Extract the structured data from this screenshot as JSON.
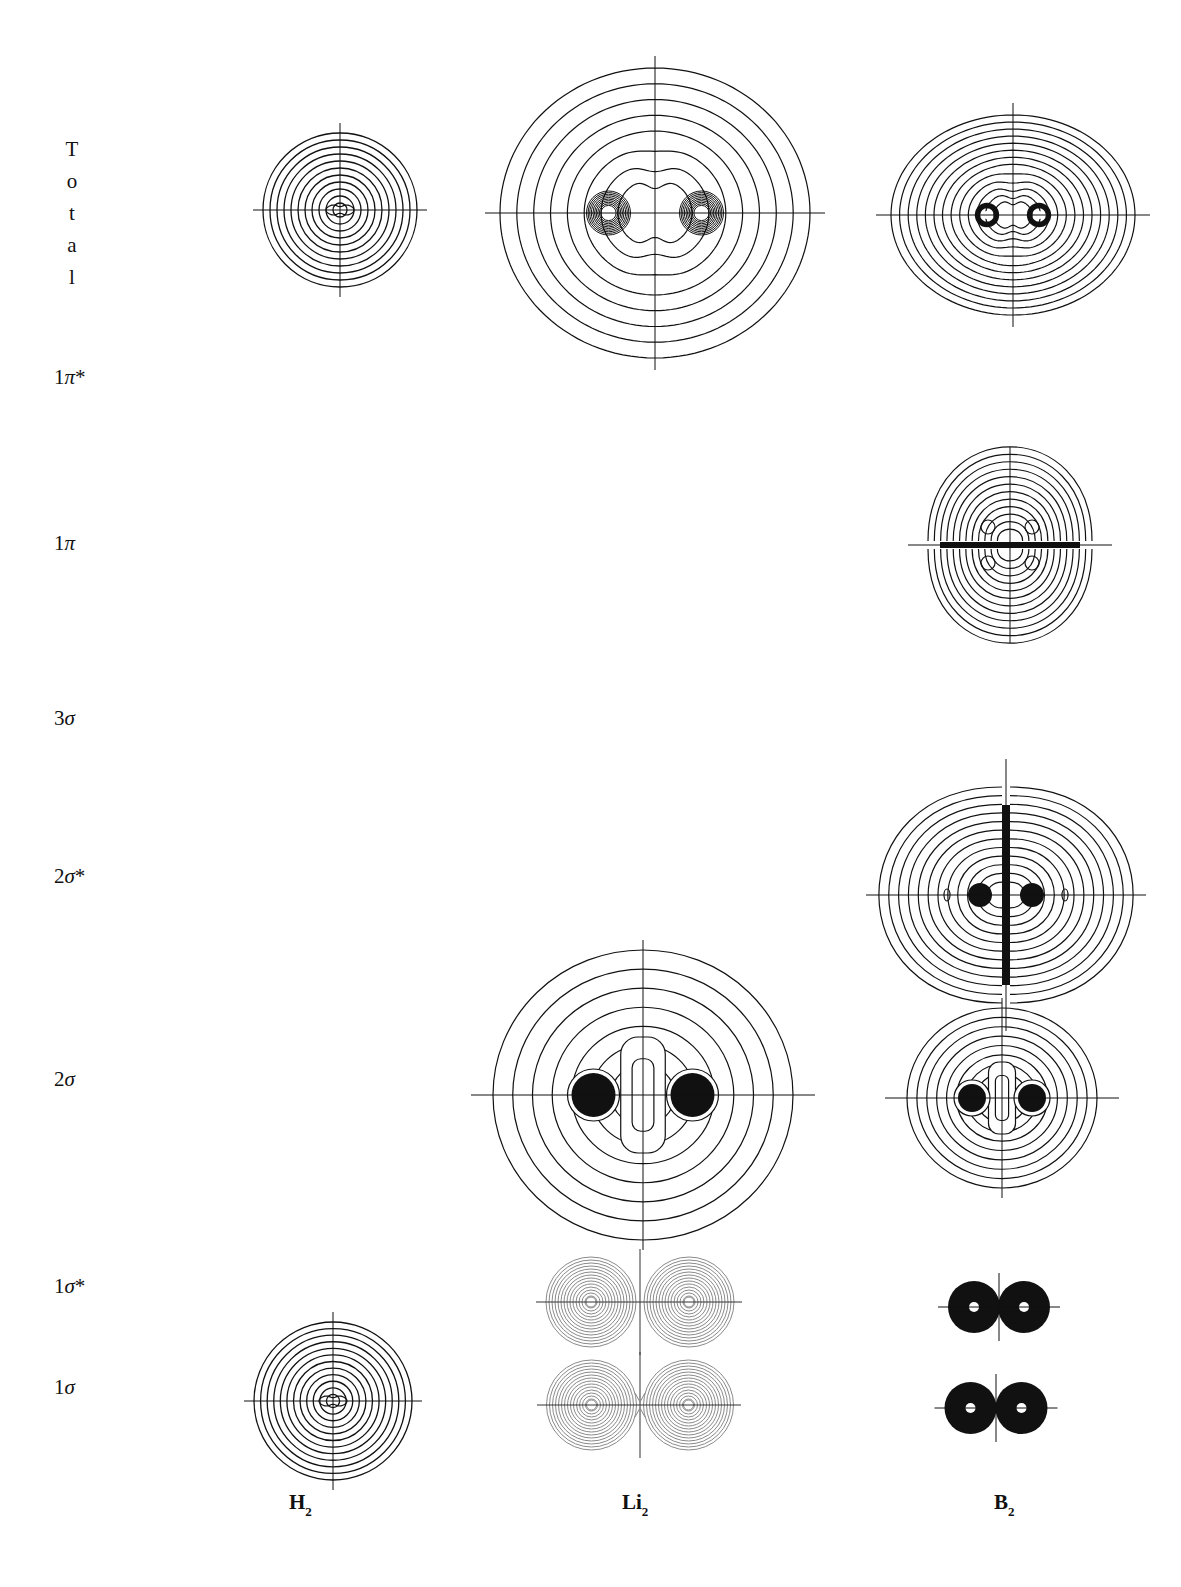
{
  "figure": {
    "row_labels": {
      "total": [
        "T",
        "o",
        "t",
        "a",
        "l"
      ],
      "pi_star_1": {
        "num": "1",
        "sym": "π",
        "star": "*"
      },
      "pi_1": {
        "num": "1",
        "sym": "π",
        "star": ""
      },
      "sigma_3": {
        "num": "3",
        "sym": "σ",
        "star": ""
      },
      "sigma_star_2": {
        "num": "2",
        "sym": "σ",
        "star": "*"
      },
      "sigma_2": {
        "num": "2",
        "sym": "σ",
        "star": ""
      },
      "sigma_star_1": {
        "num": "1",
        "sym": "σ",
        "star": "*"
      },
      "sigma_1": {
        "num": "1",
        "sym": "σ",
        "star": ""
      }
    },
    "column_labels": [
      {
        "base": "H",
        "sub": "2"
      },
      {
        "base": "Li",
        "sub": "2"
      },
      {
        "base": "B",
        "sub": "2"
      }
    ]
  },
  "plots": [
    {
      "id": "h2-total",
      "row": "Total",
      "molecule": "H2",
      "type": "concentric",
      "cx": 340,
      "cy": 210,
      "rx": 77,
      "ry": 77,
      "rings": 11,
      "core": "peanut",
      "nuclei_sep": 14
    },
    {
      "id": "li2-total",
      "row": "Total",
      "molecule": "Li2",
      "type": "total-two-center",
      "cx": 655,
      "cy": 213,
      "rx": 155,
      "ry": 145,
      "rings": 8,
      "nuclei_sep": 93,
      "core_rings": 10
    },
    {
      "id": "b2-total",
      "row": "Total",
      "molecule": "B2",
      "type": "total-two-center",
      "cx": 1013,
      "cy": 215,
      "rx": 122,
      "ry": 100,
      "rings": 13,
      "nuclei_sep": 52,
      "core_rings": 3
    },
    {
      "id": "b2-1pi",
      "row": "1π",
      "molecule": "B2",
      "type": "pi",
      "cx": 1010,
      "cy": 545,
      "rx": 82,
      "ry": 96,
      "rings": 12
    },
    {
      "id": "b2-2sigma-star",
      "row": "2σ*",
      "molecule": "B2",
      "type": "sigma-star",
      "cx": 1006,
      "cy": 895,
      "rx": 128,
      "ry": 108,
      "rings": 12,
      "nuclei_sep": 46,
      "blob_r": 12
    },
    {
      "id": "li2-2sigma",
      "row": "2σ",
      "molecule": "Li2",
      "type": "sigma-2",
      "cx": 643,
      "cy": 1095,
      "rx": 150,
      "ry": 145,
      "rings": 7,
      "nuclei_sep": 99,
      "blob_r": 22
    },
    {
      "id": "b2-2sigma",
      "row": "2σ",
      "molecule": "B2",
      "type": "sigma-2",
      "cx": 1002,
      "cy": 1098,
      "rx": 95,
      "ry": 90,
      "rings": 9,
      "nuclei_sep": 60,
      "blob_r": 14
    },
    {
      "id": "li2-1sigma-star",
      "row": "1σ*",
      "molecule": "Li2",
      "type": "core-pair",
      "cx": 640,
      "cy": 1302,
      "sep": 98,
      "r": 45,
      "rings": 14,
      "stroke": "#8a8a8a",
      "node": true
    },
    {
      "id": "li2-1sigma",
      "row": "1σ",
      "molecule": "Li2",
      "type": "core-pair",
      "cx": 640,
      "cy": 1405,
      "sep": 97,
      "r": 45,
      "rings": 14,
      "stroke": "#8a8a8a",
      "node": false
    },
    {
      "id": "b2-1sigma-star",
      "row": "1σ*",
      "molecule": "B2",
      "type": "solid-pair",
      "cx": 999,
      "cy": 1307,
      "sep": 50,
      "r": 26,
      "hole": 5
    },
    {
      "id": "b2-1sigma",
      "row": "1σ",
      "molecule": "B2",
      "type": "solid-pair",
      "cx": 996,
      "cy": 1408,
      "sep": 51,
      "r": 26,
      "hole": 5
    },
    {
      "id": "h2-1sigma",
      "row": "1σ",
      "molecule": "H2",
      "type": "concentric",
      "cx": 333,
      "cy": 1401,
      "rx": 79,
      "ry": 79,
      "rings": 12,
      "core": "peanut",
      "nuclei_sep": 14
    }
  ],
  "colors": {
    "ink": "#111111",
    "light_ink": "#8a8a8a",
    "background": "#ffffff"
  }
}
